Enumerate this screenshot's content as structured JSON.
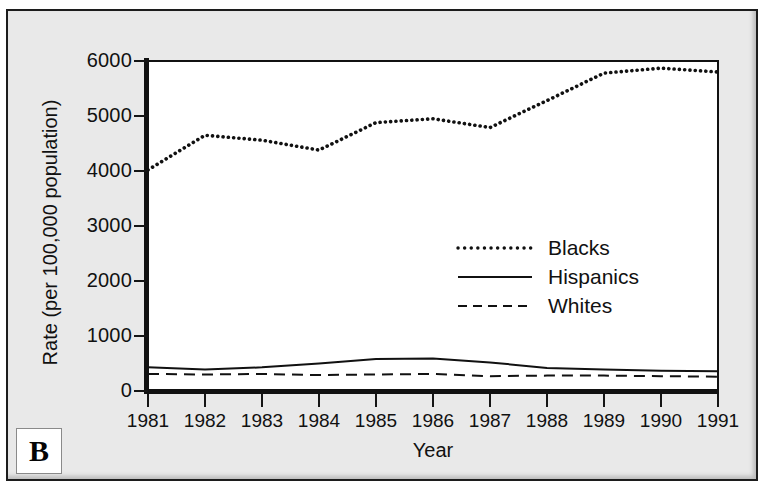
{
  "panel": {
    "letter": "B"
  },
  "chart_data": {
    "type": "line",
    "title": "",
    "xlabel": "Year",
    "ylabel": "Rate (per 100,000 population)",
    "x": [
      1981,
      1982,
      1983,
      1984,
      1985,
      1986,
      1987,
      1988,
      1989,
      1990,
      1991
    ],
    "xtick_labels": [
      "1981",
      "1982",
      "1983",
      "1984",
      "1985",
      "1986",
      "1987",
      "1988",
      "1989",
      "1990",
      "1991"
    ],
    "ytick_labels": [
      "6000",
      "5000",
      "4000",
      "3000",
      "2000",
      "1000",
      "0"
    ],
    "yticks": [
      6000,
      5000,
      4000,
      3000,
      2000,
      1000,
      0
    ],
    "xlim": [
      1981,
      1991
    ],
    "ylim": [
      0,
      6000
    ],
    "grid": false,
    "legend_position": "center-right",
    "series": [
      {
        "name": "Blacks",
        "style": "dotted",
        "color": "#111111",
        "values": [
          4020,
          4650,
          4560,
          4380,
          4880,
          4950,
          4790,
          5280,
          5780,
          5870,
          5800
        ]
      },
      {
        "name": "Hispanics",
        "style": "solid",
        "color": "#111111",
        "values": [
          430,
          390,
          430,
          500,
          580,
          590,
          520,
          420,
          390,
          370,
          360
        ]
      },
      {
        "name": "Whites",
        "style": "dashed",
        "color": "#111111",
        "values": [
          310,
          300,
          310,
          290,
          300,
          310,
          270,
          280,
          280,
          270,
          260
        ]
      }
    ]
  },
  "legend": {
    "items": [
      {
        "label": "Blacks",
        "style": "dotted"
      },
      {
        "label": "Hispanics",
        "style": "solid"
      },
      {
        "label": "Whites",
        "style": "dashed"
      }
    ]
  }
}
